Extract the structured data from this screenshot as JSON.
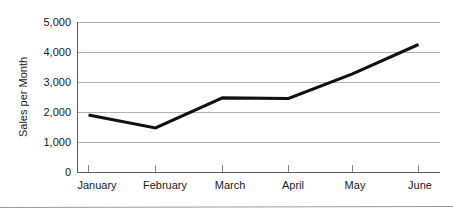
{
  "chart_data": {
    "type": "line",
    "title": "",
    "xlabel": "",
    "ylabel": "Sales per Month",
    "categories": [
      "January",
      "February",
      "March",
      "April",
      "May",
      "June"
    ],
    "values": [
      1900,
      1470,
      2470,
      2450,
      3270,
      4250
    ],
    "series": [
      {
        "name": "Sales per Month",
        "values": [
          1900,
          1470,
          2470,
          2450,
          3270,
          4250
        ],
        "color": "#101010"
      }
    ],
    "ylim": [
      0,
      5000
    ],
    "y_ticks": [
      0,
      1000,
      2000,
      3000,
      4000,
      5000
    ],
    "y_tick_labels": [
      "0",
      "1,000",
      "2,000",
      "3,000",
      "4,000",
      "5,000"
    ],
    "grid": true,
    "grid_axis": "y",
    "legend": false,
    "legend_position": "none",
    "line_color": "#101010",
    "gridline_color": "#a8a8a8",
    "axis_color": "#5a5a5a",
    "background_color": "#ffffff"
  },
  "axis": {
    "y_title": "Sales per Month",
    "y_labels": {
      "t0": "0",
      "t1": "1,000",
      "t2": "2,000",
      "t3": "3,000",
      "t4": "4,000",
      "t5": "5,000"
    },
    "x_labels": {
      "m0": "January",
      "m1": "February",
      "m2": "March",
      "m3": "April",
      "m4": "May",
      "m5": "June"
    }
  }
}
